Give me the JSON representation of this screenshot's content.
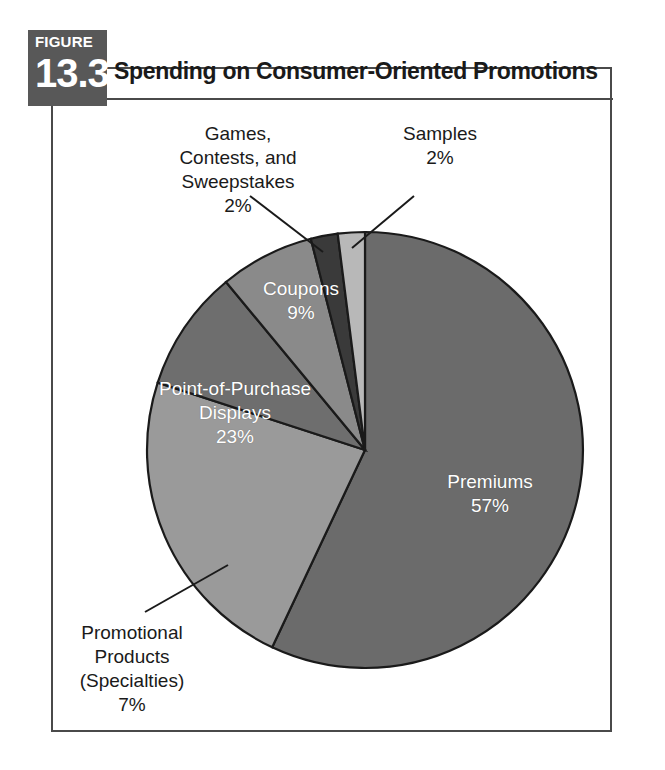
{
  "figure": {
    "badge_word": "FIGURE",
    "badge_number": "13.3",
    "title": "Spending on Consumer-Oriented Promotions"
  },
  "colors": {
    "badge_bg": "#585858",
    "frame_border": "#4a4a4a",
    "slice_premiums": "#6b6b6b",
    "slice_coupons": "#6e6e6e",
    "slice_games": "#3a3a3a",
    "slice_samples": "#b8b8b8",
    "slice_pop": "#9a9a9a",
    "slice_promotional": "#8a8a8a",
    "text_dark": "#1a1a1a",
    "text_light": "#ffffff"
  },
  "labels": {
    "games": {
      "line1": "Games,",
      "line2": "Contests, and",
      "line3": "Sweepstakes",
      "value": "2%"
    },
    "samples": {
      "line1": "Samples",
      "value": "2%"
    },
    "coupons": {
      "line1": "Coupons",
      "value": "9%"
    },
    "point_of_purchase": {
      "line1": "Point-of-Purchase",
      "line2": "Displays",
      "value": "23%"
    },
    "premiums": {
      "line1": "Premiums",
      "value": "57%"
    },
    "promotional": {
      "line1": "Promotional",
      "line2": "Products",
      "line3": "(Specialties)",
      "value": "7%"
    }
  },
  "chart_data": {
    "type": "pie",
    "title": "Spending on Consumer-Oriented Promotions",
    "xlabel": "",
    "ylabel": "",
    "units": "percent",
    "legend": "none (direct labels)",
    "grid": false,
    "labels": [
      "Premiums",
      "Point-of-Purchase Displays",
      "Coupons",
      "Promotional Products (Specialties)",
      "Games, Contests, and Sweepstakes",
      "Samples"
    ],
    "values": [
      57,
      23,
      9,
      7,
      2,
      2
    ],
    "value_labels": [
      "57%",
      "23%",
      "9%",
      "7%",
      "2%",
      "2%"
    ],
    "colors": [
      "#6b6b6b",
      "#9a9a9a",
      "#6e6e6e",
      "#8a8a8a",
      "#3a3a3a",
      "#b8b8b8"
    ],
    "total": 100,
    "start_angle_deg": -90,
    "direction": "counterclockwise"
  }
}
